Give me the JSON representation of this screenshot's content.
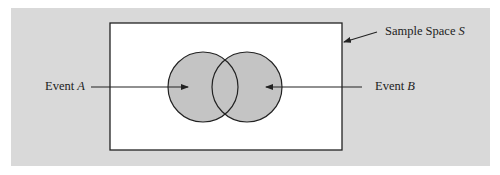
{
  "diagram": {
    "type": "venn",
    "colors": {
      "background_panel": "#d9d9d9",
      "sample_space_fill": "#ffffff",
      "event_fill": "#c4c4c4",
      "stroke": "#222222"
    },
    "sample_space": {
      "label_prefix": "Sample Space ",
      "label_var": "S"
    },
    "events": [
      {
        "label_prefix": "Event ",
        "label_var": "A"
      },
      {
        "label_prefix": "Event ",
        "label_var": "B"
      }
    ]
  }
}
